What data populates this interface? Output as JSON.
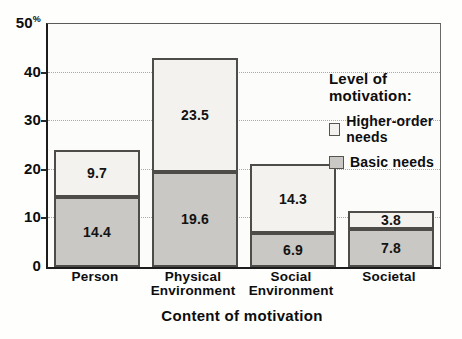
{
  "chart_data": {
    "type": "bar",
    "stacked": true,
    "title": "",
    "xlabel": "Content of motivation",
    "y_unit": "%",
    "ylim": [
      0,
      50
    ],
    "y_ticks": [
      0,
      10,
      20,
      30,
      40,
      50
    ],
    "grid": "horizontal dotted lines at 10, 20, 30, 40",
    "legend_position": "top-right inside plot",
    "categories": [
      "Person",
      "Physical Environment",
      "Social Environment",
      "Societal"
    ],
    "series": [
      {
        "name": "Basic needs",
        "color": "#c9c8c4",
        "values": [
          14.4,
          19.6,
          6.9,
          7.8
        ]
      },
      {
        "name": "Higher-order needs",
        "color": "#f3f2ee",
        "values": [
          9.7,
          23.5,
          14.3,
          3.8
        ]
      }
    ],
    "totals": [
      24.1,
      43.1,
      21.2,
      11.6
    ],
    "data_labels_shown": true
  },
  "legend": {
    "title": "Level of motivation:",
    "items": [
      {
        "label": "Higher-order needs",
        "color": "#f3f2ee"
      },
      {
        "label": "Basic needs",
        "color": "#c9c8c4"
      }
    ]
  }
}
